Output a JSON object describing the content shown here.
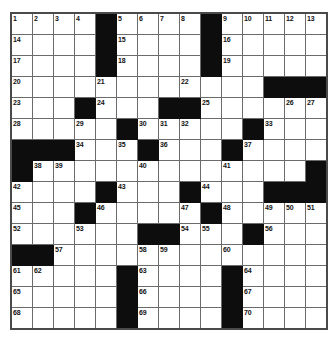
{
  "puzzle": {
    "type": "crossword-grid",
    "rows": 15,
    "columns": 15,
    "cell_size_px": 20,
    "colors": {
      "block": "#0d0d0d",
      "cell": "#ffffff",
      "gridline": "#6b6b6b",
      "border": "#4a4a4a",
      "number_text": "#111111"
    },
    "highest_clue_number": 70,
    "grid": [
      [
        {
          "block": false,
          "number": "1"
        },
        {
          "block": false,
          "number": "2"
        },
        {
          "block": false,
          "number": "3"
        },
        {
          "block": false,
          "number": "4"
        },
        {
          "block": true,
          "number": ""
        },
        {
          "block": false,
          "number": "5"
        },
        {
          "block": false,
          "number": "6"
        },
        {
          "block": false,
          "number": "7"
        },
        {
          "block": false,
          "number": "8"
        },
        {
          "block": true,
          "number": ""
        },
        {
          "block": false,
          "number": "9"
        },
        {
          "block": false,
          "number": "10"
        },
        {
          "block": false,
          "number": "11"
        },
        {
          "block": false,
          "number": "12"
        },
        {
          "block": false,
          "number": "13"
        }
      ],
      [
        {
          "block": false,
          "number": "14"
        },
        {
          "block": false,
          "number": ""
        },
        {
          "block": false,
          "number": ""
        },
        {
          "block": false,
          "number": ""
        },
        {
          "block": true,
          "number": ""
        },
        {
          "block": false,
          "number": "15"
        },
        {
          "block": false,
          "number": ""
        },
        {
          "block": false,
          "number": ""
        },
        {
          "block": false,
          "number": ""
        },
        {
          "block": true,
          "number": ""
        },
        {
          "block": false,
          "number": "16"
        },
        {
          "block": false,
          "number": ""
        },
        {
          "block": false,
          "number": ""
        },
        {
          "block": false,
          "number": ""
        },
        {
          "block": false,
          "number": ""
        }
      ],
      [
        {
          "block": false,
          "number": "17"
        },
        {
          "block": false,
          "number": ""
        },
        {
          "block": false,
          "number": ""
        },
        {
          "block": false,
          "number": ""
        },
        {
          "block": true,
          "number": ""
        },
        {
          "block": false,
          "number": "18"
        },
        {
          "block": false,
          "number": ""
        },
        {
          "block": false,
          "number": ""
        },
        {
          "block": false,
          "number": ""
        },
        {
          "block": true,
          "number": ""
        },
        {
          "block": false,
          "number": "19"
        },
        {
          "block": false,
          "number": ""
        },
        {
          "block": false,
          "number": ""
        },
        {
          "block": false,
          "number": ""
        },
        {
          "block": false,
          "number": ""
        }
      ],
      [
        {
          "block": false,
          "number": "20"
        },
        {
          "block": false,
          "number": ""
        },
        {
          "block": false,
          "number": ""
        },
        {
          "block": false,
          "number": ""
        },
        {
          "block": false,
          "number": "21"
        },
        {
          "block": false,
          "number": ""
        },
        {
          "block": false,
          "number": ""
        },
        {
          "block": false,
          "number": ""
        },
        {
          "block": false,
          "number": "22"
        },
        {
          "block": false,
          "number": ""
        },
        {
          "block": false,
          "number": ""
        },
        {
          "block": false,
          "number": ""
        },
        {
          "block": true,
          "number": ""
        },
        {
          "block": true,
          "number": ""
        },
        {
          "block": true,
          "number": ""
        }
      ],
      [
        {
          "block": false,
          "number": "23"
        },
        {
          "block": false,
          "number": ""
        },
        {
          "block": false,
          "number": ""
        },
        {
          "block": true,
          "number": ""
        },
        {
          "block": false,
          "number": "24"
        },
        {
          "block": false,
          "number": ""
        },
        {
          "block": false,
          "number": ""
        },
        {
          "block": true,
          "number": ""
        },
        {
          "block": true,
          "number": ""
        },
        {
          "block": false,
          "number": "25"
        },
        {
          "block": false,
          "number": ""
        },
        {
          "block": false,
          "number": ""
        },
        {
          "block": false,
          "number": ""
        },
        {
          "block": false,
          "number": "26"
        },
        {
          "block": false,
          "number": "27"
        }
      ],
      [
        {
          "block": false,
          "number": "28"
        },
        {
          "block": false,
          "number": ""
        },
        {
          "block": false,
          "number": ""
        },
        {
          "block": false,
          "number": "29"
        },
        {
          "block": false,
          "number": ""
        },
        {
          "block": true,
          "number": ""
        },
        {
          "block": false,
          "number": "30"
        },
        {
          "block": false,
          "number": "31"
        },
        {
          "block": false,
          "number": "32"
        },
        {
          "block": false,
          "number": ""
        },
        {
          "block": false,
          "number": ""
        },
        {
          "block": true,
          "number": ""
        },
        {
          "block": false,
          "number": "33"
        },
        {
          "block": false,
          "number": ""
        },
        {
          "block": false,
          "number": ""
        }
      ],
      [
        {
          "block": true,
          "number": ""
        },
        {
          "block": true,
          "number": ""
        },
        {
          "block": true,
          "number": ""
        },
        {
          "block": false,
          "number": "34"
        },
        {
          "block": false,
          "number": ""
        },
        {
          "block": false,
          "number": "35"
        },
        {
          "block": true,
          "number": ""
        },
        {
          "block": false,
          "number": "36"
        },
        {
          "block": false,
          "number": ""
        },
        {
          "block": false,
          "number": ""
        },
        {
          "block": true,
          "number": ""
        },
        {
          "block": false,
          "number": "37"
        },
        {
          "block": false,
          "number": ""
        },
        {
          "block": false,
          "number": ""
        },
        {
          "block": false,
          "number": ""
        }
      ],
      [
        {
          "block": true,
          "number": ""
        },
        {
          "block": false,
          "number": "38"
        },
        {
          "block": false,
          "number": "39"
        },
        {
          "block": false,
          "number": ""
        },
        {
          "block": false,
          "number": ""
        },
        {
          "block": false,
          "number": ""
        },
        {
          "block": false,
          "number": "40"
        },
        {
          "block": false,
          "number": ""
        },
        {
          "block": false,
          "number": ""
        },
        {
          "block": false,
          "number": ""
        },
        {
          "block": false,
          "number": "41"
        },
        {
          "block": false,
          "number": ""
        },
        {
          "block": false,
          "number": ""
        },
        {
          "block": false,
          "number": ""
        },
        {
          "block": true,
          "number": ""
        }
      ],
      [
        {
          "block": false,
          "number": "42"
        },
        {
          "block": false,
          "number": ""
        },
        {
          "block": false,
          "number": ""
        },
        {
          "block": false,
          "number": ""
        },
        {
          "block": true,
          "number": ""
        },
        {
          "block": false,
          "number": "43"
        },
        {
          "block": false,
          "number": ""
        },
        {
          "block": false,
          "number": ""
        },
        {
          "block": true,
          "number": ""
        },
        {
          "block": false,
          "number": "44"
        },
        {
          "block": false,
          "number": ""
        },
        {
          "block": false,
          "number": ""
        },
        {
          "block": true,
          "number": ""
        },
        {
          "block": true,
          "number": ""
        },
        {
          "block": true,
          "number": ""
        }
      ],
      [
        {
          "block": false,
          "number": "45"
        },
        {
          "block": false,
          "number": ""
        },
        {
          "block": false,
          "number": ""
        },
        {
          "block": true,
          "number": ""
        },
        {
          "block": false,
          "number": "46"
        },
        {
          "block": false,
          "number": ""
        },
        {
          "block": false,
          "number": ""
        },
        {
          "block": false,
          "number": ""
        },
        {
          "block": false,
          "number": "47"
        },
        {
          "block": true,
          "number": ""
        },
        {
          "block": false,
          "number": "48"
        },
        {
          "block": false,
          "number": ""
        },
        {
          "block": false,
          "number": "49"
        },
        {
          "block": false,
          "number": "50"
        },
        {
          "block": false,
          "number": "51"
        }
      ],
      [
        {
          "block": false,
          "number": "52"
        },
        {
          "block": false,
          "number": ""
        },
        {
          "block": false,
          "number": ""
        },
        {
          "block": false,
          "number": "53"
        },
        {
          "block": false,
          "number": ""
        },
        {
          "block": false,
          "number": ""
        },
        {
          "block": true,
          "number": ""
        },
        {
          "block": true,
          "number": ""
        },
        {
          "block": false,
          "number": "54"
        },
        {
          "block": false,
          "number": "55"
        },
        {
          "block": false,
          "number": ""
        },
        {
          "block": true,
          "number": ""
        },
        {
          "block": false,
          "number": "56"
        },
        {
          "block": false,
          "number": ""
        },
        {
          "block": false,
          "number": ""
        }
      ],
      [
        {
          "block": true,
          "number": ""
        },
        {
          "block": true,
          "number": ""
        },
        {
          "block": false,
          "number": "57"
        },
        {
          "block": false,
          "number": ""
        },
        {
          "block": false,
          "number": ""
        },
        {
          "block": false,
          "number": ""
        },
        {
          "block": false,
          "number": "58"
        },
        {
          "block": false,
          "number": "59"
        },
        {
          "block": false,
          "number": ""
        },
        {
          "block": false,
          "number": ""
        },
        {
          "block": false,
          "number": "60"
        },
        {
          "block": false,
          "number": ""
        },
        {
          "block": false,
          "number": ""
        },
        {
          "block": false,
          "number": ""
        },
        {
          "block": false,
          "number": ""
        }
      ],
      [
        {
          "block": false,
          "number": "61"
        },
        {
          "block": false,
          "number": "62"
        },
        {
          "block": false,
          "number": ""
        },
        {
          "block": false,
          "number": ""
        },
        {
          "block": false,
          "number": ""
        },
        {
          "block": true,
          "number": ""
        },
        {
          "block": false,
          "number": "63"
        },
        {
          "block": false,
          "number": ""
        },
        {
          "block": false,
          "number": ""
        },
        {
          "block": false,
          "number": ""
        },
        {
          "block": true,
          "number": ""
        },
        {
          "block": false,
          "number": "64"
        },
        {
          "block": false,
          "number": ""
        },
        {
          "block": false,
          "number": ""
        },
        {
          "block": false,
          "number": ""
        }
      ],
      [
        {
          "block": false,
          "number": "65"
        },
        {
          "block": false,
          "number": ""
        },
        {
          "block": false,
          "number": ""
        },
        {
          "block": false,
          "number": ""
        },
        {
          "block": false,
          "number": ""
        },
        {
          "block": true,
          "number": ""
        },
        {
          "block": false,
          "number": "66"
        },
        {
          "block": false,
          "number": ""
        },
        {
          "block": false,
          "number": ""
        },
        {
          "block": false,
          "number": ""
        },
        {
          "block": true,
          "number": ""
        },
        {
          "block": false,
          "number": "67"
        },
        {
          "block": false,
          "number": ""
        },
        {
          "block": false,
          "number": ""
        },
        {
          "block": false,
          "number": ""
        }
      ],
      [
        {
          "block": false,
          "number": "68"
        },
        {
          "block": false,
          "number": ""
        },
        {
          "block": false,
          "number": ""
        },
        {
          "block": false,
          "number": ""
        },
        {
          "block": false,
          "number": ""
        },
        {
          "block": true,
          "number": ""
        },
        {
          "block": false,
          "number": "69"
        },
        {
          "block": false,
          "number": ""
        },
        {
          "block": false,
          "number": ""
        },
        {
          "block": false,
          "number": ""
        },
        {
          "block": true,
          "number": ""
        },
        {
          "block": false,
          "number": "70"
        },
        {
          "block": false,
          "number": ""
        },
        {
          "block": false,
          "number": ""
        },
        {
          "block": false,
          "number": ""
        }
      ]
    ]
  }
}
